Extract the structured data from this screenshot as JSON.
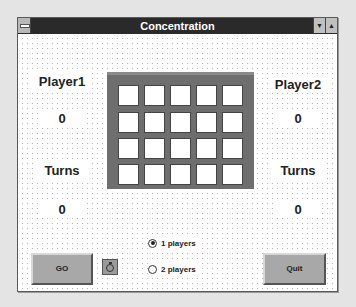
{
  "window": {
    "title": "Concentration",
    "controls": {
      "minimize_glyph": "▼",
      "maximize_glyph": "▲"
    }
  },
  "player1": {
    "name": "Player1",
    "score": "0",
    "turns_label": "Turns",
    "turns": "0"
  },
  "player2": {
    "name": "Player2",
    "score": "0",
    "turns_label": "Turns",
    "turns": "0"
  },
  "board": {
    "rows": 4,
    "cols": 5,
    "cards_face_down": 20
  },
  "mode": {
    "options": [
      {
        "label": "1 players",
        "selected": true
      },
      {
        "label": "2 players",
        "selected": false
      }
    ]
  },
  "buttons": {
    "go": "GO",
    "quit": "Quit",
    "timer_icon": "stopwatch-icon"
  },
  "colors": {
    "titlebar": "#2a2a2a",
    "board": "#6e6e6e",
    "button": "#a8a8a8"
  }
}
